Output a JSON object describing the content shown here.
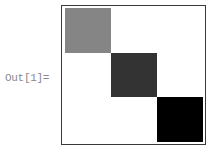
{
  "output_label": "Out[1]=",
  "chart_data": {
    "type": "heatmap",
    "title": "",
    "xlabel": "",
    "ylabel": "",
    "rows": 3,
    "cols": 3,
    "matrix": [
      [
        1,
        0,
        0
      ],
      [
        0,
        2,
        0
      ],
      [
        0,
        0,
        3
      ]
    ],
    "cell_colors": [
      [
        "#858585",
        "#ffffff",
        "#ffffff"
      ],
      [
        "#ffffff",
        "#333333",
        "#ffffff"
      ],
      [
        "#ffffff",
        "#ffffff",
        "#000000"
      ]
    ],
    "frame": true,
    "grid": false,
    "legend": null
  }
}
